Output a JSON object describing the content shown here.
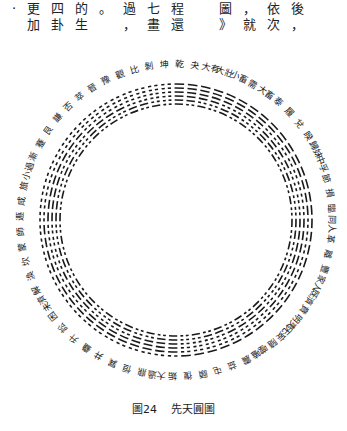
{
  "top_text": {
    "line1": "·更四的。過七程　圖，依後",
    "line2": " 加卦生　，畫還　》就次，"
  },
  "diagram": {
    "title": "先天圓圖",
    "center": [
      176,
      180
    ],
    "inner_radius": 116,
    "outer_radius": 136,
    "label_radius": 156,
    "hexagram_count": 64,
    "labels": [
      "乾",
      "夬",
      "大有",
      "大壯",
      "小畜",
      "需",
      "大畜",
      "泰",
      "履",
      "兌",
      "睽",
      "歸妹",
      "中孚",
      "節",
      "損",
      "臨",
      "同人",
      "革",
      "離",
      "豐",
      "家人",
      "既濟",
      "賁",
      "明夷",
      "无妄",
      "隨",
      "噬嗑",
      "震",
      "益",
      "屯",
      "頤",
      "復",
      "姤",
      "大過",
      "鼎",
      "恒",
      "巽",
      "井",
      "蠱",
      "升",
      "訟",
      "困",
      "未濟",
      "解",
      "渙",
      "坎",
      "蒙",
      "師",
      "遯",
      "咸",
      "旅",
      "小過",
      "漸",
      "蹇",
      "艮",
      "謙",
      "否",
      "萃",
      "晉",
      "豫",
      "觀",
      "比",
      "剝",
      "坤"
    ]
  },
  "caption": {
    "figure_label": "圖24",
    "title": "先天圓圖"
  }
}
